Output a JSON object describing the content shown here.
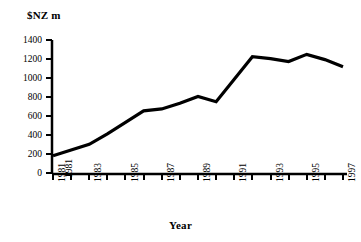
{
  "chart_data": {
    "type": "line",
    "title": "",
    "ylabel": "$NZ m",
    "xlabel": "Year",
    "grid": false,
    "legend": "none",
    "ylim": [
      0,
      1400
    ],
    "ytick_labels": [
      "1400",
      "1200",
      "1000",
      "800",
      "600",
      "400",
      "200",
      "0"
    ],
    "ytick_values": [
      1400,
      1200,
      1000,
      800,
      600,
      400,
      200,
      0
    ],
    "xlim": [
      1981,
      1997
    ],
    "xtick_labels": [
      "1981",
      "1983",
      "1985",
      "1987",
      "1989",
      "1991",
      "1993",
      "1995",
      "1997"
    ],
    "xtick_values": [
      1981,
      1983,
      1985,
      1987,
      1989,
      1991,
      1993,
      1995,
      1997
    ],
    "x": [
      1981,
      1982,
      1983,
      1984,
      1985,
      1986,
      1987,
      1988,
      1989,
      1990,
      1991,
      1992,
      1993,
      1994,
      1995,
      1996,
      1997
    ],
    "values": [
      190,
      250,
      310,
      420,
      540,
      660,
      680,
      740,
      810,
      755,
      990,
      1225,
      1205,
      1175,
      1250,
      1195,
      1120
    ],
    "series_name": "",
    "line_color": "#000000",
    "axis_color": "#000000"
  }
}
